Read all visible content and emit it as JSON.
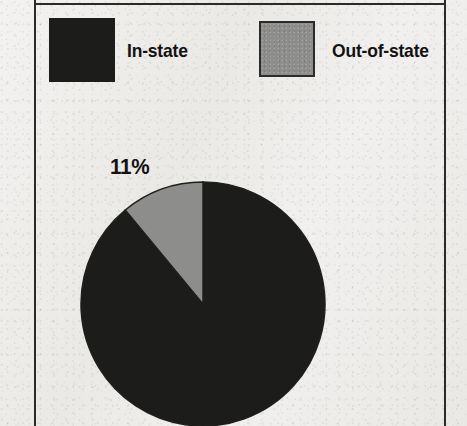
{
  "figure": {
    "background_color": "#efeeec",
    "frame_color": "#2a2a28"
  },
  "legend": {
    "position": "top",
    "items": [
      {
        "label": "In-state",
        "color": "#1c1c1a",
        "swatch": "filled-square"
      },
      {
        "label": "Out-of-state",
        "color": "#8d8d8b",
        "swatch": "outlined-square"
      }
    ]
  },
  "labels": {
    "out_of_state_percent": "11%"
  },
  "chart_data": {
    "type": "pie",
    "title": "",
    "categories": [
      "In-state",
      "Out-of-state"
    ],
    "values": [
      89,
      11
    ],
    "value_unit": "percent",
    "data_labels": [
      "",
      "11%"
    ],
    "colors": [
      "#1c1c1a",
      "#8d8d8b"
    ],
    "start_angle_deg": 90,
    "direction": "counterclockwise",
    "legend": {
      "position": "top",
      "entries": [
        "In-state",
        "Out-of-state"
      ]
    }
  }
}
